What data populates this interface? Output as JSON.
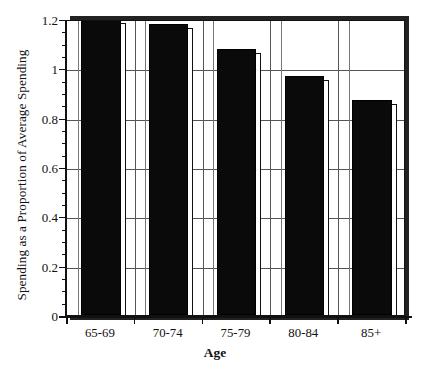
{
  "chart_data": {
    "type": "bar",
    "title": "",
    "xlabel": "Age",
    "ylabel": "Spending as a Proportion of Average Spending",
    "categories": [
      "65-69",
      "70-74",
      "75-79",
      "80-84",
      "85+"
    ],
    "values": [
      1.2,
      1.18,
      1.08,
      0.97,
      0.87
    ],
    "ylim": [
      0,
      1.2
    ],
    "xlim_categories": 5,
    "ytick_labels": [
      "0",
      "0.2",
      "0.4",
      "0.6",
      "0.8",
      "1",
      "1.2"
    ],
    "ytick_values": [
      0,
      0.2,
      0.4,
      0.6,
      0.8,
      1.0,
      1.2
    ],
    "yminor_step": 0.05,
    "grid": "both",
    "legend": "none",
    "bar_color": "#0a0a0a",
    "frame_color": "#111111",
    "grid_color": "#555555",
    "background": "#ffffff",
    "style": "3d-offset-bars"
  },
  "axes": {
    "y_title": "Spending as a Proportion of Average Spending",
    "x_title": "Age"
  }
}
